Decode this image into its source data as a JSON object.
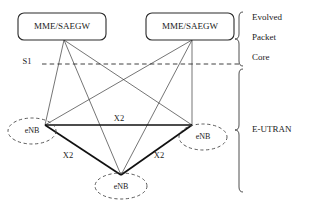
{
  "diagram": {
    "core_nodes": [
      {
        "id": "mme-left",
        "label": "MME/SAEGW"
      },
      {
        "id": "mme-right",
        "label": "MME/SAEGW"
      }
    ],
    "access_nodes": [
      {
        "id": "enb-left",
        "label": "eNB"
      },
      {
        "id": "enb-right",
        "label": "eNB"
      },
      {
        "id": "enb-bottom",
        "label": "eNB"
      }
    ],
    "interfaces": {
      "s1_label": "S1",
      "x2_top_label": "X2",
      "x2_left_label": "X2",
      "x2_right_label": "X2"
    },
    "regions": [
      {
        "id": "epc",
        "lines": [
          "Evolved",
          "Packet",
          "Core"
        ]
      },
      {
        "id": "e-utran",
        "lines": [
          "E-UTRAN"
        ]
      }
    ],
    "colors": {
      "stroke": "#2b2b2b",
      "link": "#3a3a3a",
      "x2_link": "#111111",
      "background": "#ffffff"
    }
  }
}
